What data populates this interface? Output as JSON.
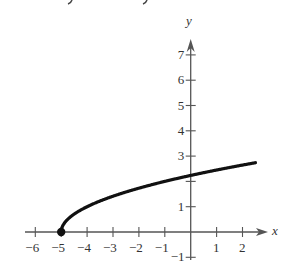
{
  "chart_data": {
    "type": "line",
    "title": "",
    "function": "y = sqrt(x + 5)",
    "xlabel": "x",
    "ylabel": "y",
    "xlim": [
      -6.5,
      2.9
    ],
    "ylim": [
      -1.4,
      7.8
    ],
    "x_ticks": [
      -6,
      -5,
      -4,
      -3,
      -2,
      -1,
      1,
      2
    ],
    "x_tick_labels": [
      "−6",
      "−5",
      "−4",
      "−3",
      "−2",
      "−1",
      "1",
      "2"
    ],
    "y_ticks": [
      -1,
      1,
      2,
      3,
      4,
      5,
      6,
      7
    ],
    "y_tick_labels": [
      "−1",
      "1",
      "",
      "3",
      "4",
      "5",
      "6",
      "7"
    ],
    "grid": false,
    "legend": null,
    "series": [
      {
        "name": "sqrt(x+5)",
        "color": "#111111",
        "x": [
          -5,
          -4.9,
          -4.75,
          -4.5,
          -4,
          -3.5,
          -3,
          -2,
          -1,
          0,
          1,
          2,
          2.5
        ],
        "y": [
          0,
          0.316,
          0.5,
          0.707,
          1.0,
          1.225,
          1.414,
          1.732,
          2.0,
          2.236,
          2.449,
          2.646,
          2.739
        ]
      }
    ],
    "annotations": [
      {
        "type": "filled-point",
        "x": -5,
        "y": 0
      }
    ]
  },
  "labels": {
    "x_axis": "x",
    "y_axis": "y"
  },
  "colors": {
    "axis": "#555555",
    "curve": "#111111"
  }
}
